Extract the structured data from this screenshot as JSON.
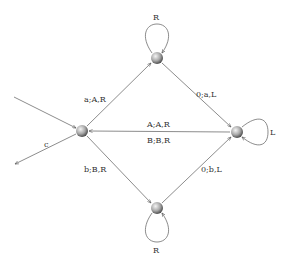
{
  "diagram": {
    "type": "state-machine",
    "colors": {
      "edge": "#6e6e6e",
      "label": "#333333",
      "node_light": "#f2f2f2",
      "node_dark": "#4a4a4a"
    },
    "nodes": [
      {
        "id": "left",
        "x": 82,
        "y": 131
      },
      {
        "id": "top",
        "x": 157,
        "y": 58
      },
      {
        "id": "right",
        "x": 237,
        "y": 132
      },
      {
        "id": "bottom",
        "x": 157,
        "y": 208
      }
    ],
    "edges": [
      {
        "from": "left",
        "to": "top",
        "label": "a;A,R"
      },
      {
        "from": "top",
        "to": "right",
        "label": "0;a,L"
      },
      {
        "from": "left",
        "to": "bottom",
        "label": "b;B,R"
      },
      {
        "from": "bottom",
        "to": "right",
        "label": "0;b,L"
      },
      {
        "from": "right",
        "to": "left",
        "label_top": "A;A,R",
        "label_bottom": "B;B,R"
      },
      {
        "from": "external",
        "to": "left",
        "label": ""
      },
      {
        "from": "left",
        "to": "external",
        "label": "c"
      }
    ],
    "loops": [
      {
        "node": "top",
        "label": "R",
        "side": "above"
      },
      {
        "node": "right",
        "label": "L",
        "side": "right"
      },
      {
        "node": "bottom",
        "label": "R",
        "side": "below"
      }
    ]
  }
}
